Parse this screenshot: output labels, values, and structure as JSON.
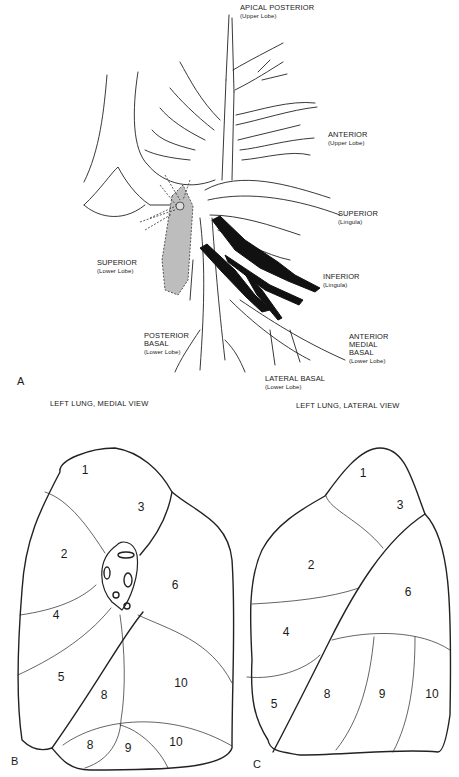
{
  "panel_a": {
    "letter": "A",
    "labels": [
      {
        "id": "apical-posterior",
        "main": "APICAL POSTERIOR",
        "sub": "(Upper Lobe)",
        "x": 240,
        "y": 4
      },
      {
        "id": "anterior-upper",
        "main": "ANTERIOR",
        "sub": "(Upper Lobe)",
        "x": 328,
        "y": 131
      },
      {
        "id": "superior-lingula",
        "main": "SUPERIOR",
        "sub": "(Lingula)",
        "x": 338,
        "y": 210
      },
      {
        "id": "superior-lower",
        "main": "SUPERIOR",
        "sub": "(Lower Lobe)",
        "x": 97,
        "y": 259
      },
      {
        "id": "inferior-lingula",
        "main": "INFERIOR",
        "sub": "(Lingula)",
        "x": 323,
        "y": 273
      },
      {
        "id": "posterior-basal",
        "main": "POSTERIOR BASAL",
        "main_lines": [
          "POSTERIOR",
          "BASAL"
        ],
        "sub": "(Lower Lobe)",
        "x": 144,
        "y": 332
      },
      {
        "id": "anterior-medial-basal",
        "main_lines": [
          "ANTERIOR",
          "MEDIAL",
          "BASAL"
        ],
        "sub": "(Lower Lobe)",
        "x": 349,
        "y": 333
      },
      {
        "id": "lateral-basal",
        "main": "LATERAL BASAL",
        "sub": "(Lower Lobe)",
        "x": 265,
        "y": 375
      }
    ]
  },
  "panel_b": {
    "letter": "B",
    "title": "LEFT LUNG, MEDIAL VIEW",
    "segments": [
      {
        "n": "1",
        "x": 85,
        "y": 470
      },
      {
        "n": "3",
        "x": 141,
        "y": 507
      },
      {
        "n": "2",
        "x": 64,
        "y": 554
      },
      {
        "n": "6",
        "x": 175,
        "y": 585
      },
      {
        "n": "4",
        "x": 56,
        "y": 615
      },
      {
        "n": "5",
        "x": 61,
        "y": 677
      },
      {
        "n": "10",
        "x": 181,
        "y": 683
      },
      {
        "n": "8",
        "x": 104,
        "y": 695
      },
      {
        "n": "8",
        "x": 90,
        "y": 745
      },
      {
        "n": "9",
        "x": 128,
        "y": 748
      },
      {
        "n": "10",
        "x": 176,
        "y": 742
      }
    ]
  },
  "panel_c": {
    "letter": "C",
    "title": "LEFT LUNG, LATERAL VIEW",
    "segments": [
      {
        "n": "1",
        "x": 363,
        "y": 473
      },
      {
        "n": "3",
        "x": 400,
        "y": 505
      },
      {
        "n": "2",
        "x": 311,
        "y": 565
      },
      {
        "n": "6",
        "x": 408,
        "y": 592
      },
      {
        "n": "4",
        "x": 286,
        "y": 632
      },
      {
        "n": "5",
        "x": 274,
        "y": 704
      },
      {
        "n": "8",
        "x": 327,
        "y": 694
      },
      {
        "n": "9",
        "x": 382,
        "y": 694
      },
      {
        "n": "10",
        "x": 432,
        "y": 694
      }
    ]
  }
}
